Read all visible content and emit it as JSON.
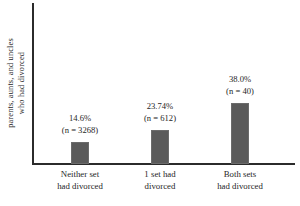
{
  "chart_data": {
    "type": "bar",
    "title": "",
    "xlabel": "",
    "ylabel": "parents, aunts, and uncles who had divorced",
    "ylim": [
      0,
      44
    ],
    "grid": false,
    "legend": "none",
    "categories": [
      "Neither set had divorced",
      "1 set had divorced",
      "Both sets had divorced"
    ],
    "values": [
      14.6,
      23.74,
      38.0
    ],
    "counts": [
      3268,
      612,
      40
    ],
    "bar_color": "#5a5a5a",
    "axis_color": "#2b2b2b",
    "text_color": "#262626"
  },
  "axis": {
    "y_label_line1": "parents, aunts, and uncles",
    "y_label_line2": "who had divorced"
  },
  "bars": [
    {
      "percent_label": "14.6%",
      "count_label": "(n = 3268)",
      "category_line1": "Neither set",
      "category_line2": "had divorced",
      "bar_height_px": 22,
      "label_bottom_px": 28
    },
    {
      "percent_label": "23.74%",
      "count_label": "(n = 612)",
      "category_line1": "1 set had",
      "category_line2": "divorced",
      "bar_height_px": 34,
      "label_bottom_px": 40
    },
    {
      "percent_label": "38.0%",
      "count_label": "(n = 40)",
      "category_line1": "Both sets",
      "category_line2": "had divorced",
      "bar_height_px": 61,
      "label_bottom_px": 67
    }
  ]
}
